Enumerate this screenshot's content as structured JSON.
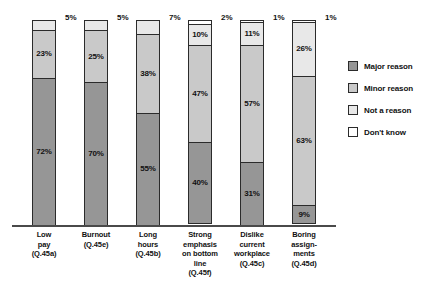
{
  "chart_data": {
    "type": "bar",
    "subtype": "stacked-100-percent",
    "title": "",
    "xlabel": "",
    "ylabel": "",
    "ylim": [
      0,
      100
    ],
    "grid": false,
    "legend_position": "right",
    "categories": [
      "Low pay (Q.45a)",
      "Burnout (Q.45e)",
      "Long hours (Q.45b)",
      "Strong emphasis on bottom line (Q.45f)",
      "Dislike current workplace (Q.45c)",
      "Boring assignments (Q.45d)"
    ],
    "series": [
      {
        "name": "Major reason",
        "color": "#969696",
        "values": [
          72,
          70,
          55,
          40,
          31,
          9
        ]
      },
      {
        "name": "Minor reason",
        "color": "#c9c9c9",
        "values": [
          23,
          25,
          38,
          47,
          57,
          63
        ]
      },
      {
        "name": "Not a reason",
        "color": "#e8e8e8",
        "values": [
          5,
          5,
          7,
          10,
          11,
          26
        ]
      },
      {
        "name": "Don't know",
        "color": "#ffffff",
        "values": [
          0,
          0,
          0,
          2,
          1,
          1
        ]
      }
    ]
  },
  "legend": {
    "items": [
      {
        "label": "Major reason",
        "swatch": "#969696"
      },
      {
        "label": "Minor reason",
        "swatch": "#c9c9c9"
      },
      {
        "label": "Not a reason",
        "swatch": "#e8e8e8"
      },
      {
        "label": "Don't know",
        "swatch": "#ffffff"
      }
    ]
  },
  "bars": [
    {
      "key": "low-pay",
      "label_lines": [
        "Low",
        "pay",
        "(Q.45a)"
      ],
      "segments": [
        {
          "series": "Not a reason",
          "value": 5,
          "text": "",
          "cls": "seg-not"
        },
        {
          "series": "Minor reason",
          "value": 23,
          "text": "23%",
          "cls": "seg-minor"
        },
        {
          "series": "Major reason",
          "value": 72,
          "text": "72%",
          "cls": "seg-major"
        }
      ],
      "outside_label": "5%"
    },
    {
      "key": "burnout",
      "label_lines": [
        "Burnout",
        "(Q.45e)"
      ],
      "segments": [
        {
          "series": "Not a reason",
          "value": 5,
          "text": "",
          "cls": "seg-not"
        },
        {
          "series": "Minor reason",
          "value": 25,
          "text": "25%",
          "cls": "seg-minor"
        },
        {
          "series": "Major reason",
          "value": 70,
          "text": "70%",
          "cls": "seg-major"
        }
      ],
      "outside_label": "5%"
    },
    {
      "key": "long-hours",
      "label_lines": [
        "Long",
        "hours",
        "(Q.45b)"
      ],
      "segments": [
        {
          "series": "Not a reason",
          "value": 7,
          "text": "",
          "cls": "seg-not"
        },
        {
          "series": "Minor reason",
          "value": 38,
          "text": "38%",
          "cls": "seg-minor"
        },
        {
          "series": "Major reason",
          "value": 55,
          "text": "55%",
          "cls": "seg-major"
        }
      ],
      "outside_label": "7%"
    },
    {
      "key": "bottom-line",
      "label_lines": [
        "Strong",
        "emphasis",
        "on bottom",
        "line",
        "(Q.45f)"
      ],
      "segments": [
        {
          "series": "Don't know",
          "value": 2,
          "text": "",
          "cls": "seg-dk"
        },
        {
          "series": "Not a reason",
          "value": 10,
          "text": "10%",
          "cls": "seg-not"
        },
        {
          "series": "Minor reason",
          "value": 47,
          "text": "47%",
          "cls": "seg-minor"
        },
        {
          "series": "Major reason",
          "value": 40,
          "text": "40%",
          "cls": "seg-major"
        }
      ],
      "outside_label": "2%"
    },
    {
      "key": "dislike-workplace",
      "label_lines": [
        "Dislike",
        "current",
        "workplace",
        "(Q.45c)"
      ],
      "segments": [
        {
          "series": "Don't know",
          "value": 1,
          "text": "",
          "cls": "seg-dk"
        },
        {
          "series": "Not a reason",
          "value": 11,
          "text": "11%",
          "cls": "seg-not"
        },
        {
          "series": "Minor reason",
          "value": 57,
          "text": "57%",
          "cls": "seg-minor"
        },
        {
          "series": "Major reason",
          "value": 31,
          "text": "31%",
          "cls": "seg-major"
        }
      ],
      "outside_label": "1%"
    },
    {
      "key": "boring-assignments",
      "label_lines": [
        "Boring",
        "assign-",
        "ments",
        "(Q.45d)"
      ],
      "segments": [
        {
          "series": "Don't know",
          "value": 1,
          "text": "",
          "cls": "seg-dk"
        },
        {
          "series": "Not a reason",
          "value": 26,
          "text": "26%",
          "cls": "seg-not"
        },
        {
          "series": "Minor reason",
          "value": 63,
          "text": "63%",
          "cls": "seg-minor"
        },
        {
          "series": "Major reason",
          "value": 9,
          "text": "9%",
          "cls": "seg-major"
        }
      ],
      "outside_label": "1%"
    }
  ],
  "layout": {
    "bar_width": 24,
    "bar_pitch": 52,
    "first_bar_left": 14
  }
}
